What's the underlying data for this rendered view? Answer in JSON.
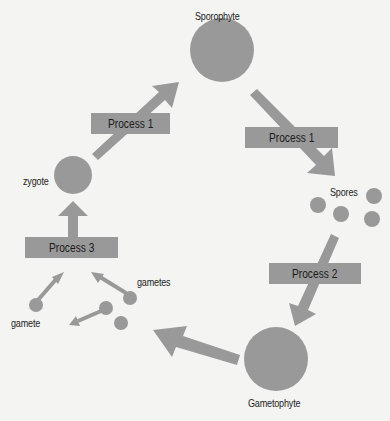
{
  "diagram": {
    "type": "life-cycle",
    "colors": {
      "shape": "#999999",
      "background": "#f4f4f2",
      "text": "#222222"
    },
    "nodes": {
      "sporophyte": "Sporophyte",
      "spores": "Spores",
      "gametophyte": "Gametophyte",
      "gametes": "gametes",
      "gamete": "gamete",
      "zygote": "zygote"
    },
    "processes": {
      "zygote_to_sporophyte": "Process 1",
      "sporophyte_to_spores": "Process 1",
      "spores_to_gametophyte": "Process 2",
      "gametes_to_zygote": "Process 3"
    }
  }
}
